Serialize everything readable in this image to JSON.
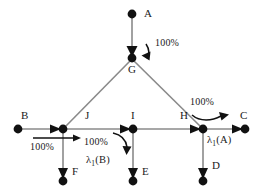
{
  "diagram": {
    "type": "directed-graph",
    "background_color": "#ffffff",
    "node_color": "#111111",
    "edge_color": "#8a8a8a",
    "nodes": [
      {
        "id": "A",
        "label": "A",
        "x": 132,
        "y": 14,
        "label_x": 144,
        "label_y": 9
      },
      {
        "id": "G",
        "label": "G",
        "x": 132,
        "y": 58,
        "label_x": 129,
        "label_y": 66
      },
      {
        "id": "B",
        "label": "B",
        "x": 18,
        "y": 129,
        "label_x": 22,
        "label_y": 112
      },
      {
        "id": "J",
        "label": "J",
        "x": 63,
        "y": 129,
        "label_x": 85,
        "label_y": 112
      },
      {
        "id": "I",
        "label": "I",
        "x": 133,
        "y": 129,
        "label_x": 131,
        "label_y": 112
      },
      {
        "id": "H",
        "label": "H",
        "x": 203,
        "y": 129,
        "label_x": 180,
        "label_y": 112
      },
      {
        "id": "C",
        "label": "C",
        "x": 245,
        "y": 129,
        "label_x": 240,
        "label_y": 112
      },
      {
        "id": "F",
        "label": "F",
        "x": 63,
        "y": 181,
        "label_x": 71,
        "label_y": 168
      },
      {
        "id": "E",
        "label": "E",
        "x": 133,
        "y": 181,
        "label_x": 142,
        "label_y": 168
      },
      {
        "id": "D",
        "label": "D",
        "x": 203,
        "y": 181,
        "label_x": 212,
        "label_y": 162
      }
    ],
    "edges": [
      {
        "from": "A",
        "to": "G",
        "direction": "down"
      },
      {
        "from": "G",
        "to": "J",
        "direction": "down-left"
      },
      {
        "from": "G",
        "to": "H",
        "direction": "down-right"
      },
      {
        "from": "B",
        "to": "J",
        "direction": "right"
      },
      {
        "from": "J",
        "to": "I",
        "direction": "right"
      },
      {
        "from": "I",
        "to": "H",
        "direction": "right"
      },
      {
        "from": "H",
        "to": "C",
        "direction": "right"
      },
      {
        "from": "J",
        "to": "F",
        "direction": "down"
      },
      {
        "from": "I",
        "to": "E",
        "direction": "down"
      },
      {
        "from": "H",
        "to": "D",
        "direction": "down"
      }
    ],
    "annotations": [
      {
        "id": "pct-a-g",
        "text": "100%",
        "x": 147,
        "y": 42,
        "kind": "percent"
      },
      {
        "id": "pct-b-j",
        "text": "100%",
        "x": 33,
        "y": 146,
        "kind": "percent"
      },
      {
        "id": "pct-i-e",
        "text": "100%",
        "x": 98,
        "y": 141,
        "kind": "percent"
      },
      {
        "id": "lam-i-e",
        "text": "λ1(B)",
        "x": 98,
        "y": 159,
        "kind": "lambda",
        "base": "λ",
        "subscript": "1",
        "arg": "(B)"
      },
      {
        "id": "pct-h-c",
        "text": "100%",
        "x": 190,
        "y": 102,
        "kind": "percent"
      },
      {
        "id": "lam-h-c",
        "text": "λ1(A)",
        "x": 208,
        "y": 139,
        "kind": "lambda",
        "base": "λ",
        "subscript": "1",
        "arg": "(A)"
      }
    ]
  }
}
